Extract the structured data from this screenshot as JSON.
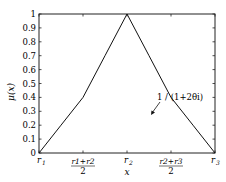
{
  "chart_data": {
    "type": "line",
    "title": "",
    "xlabel": "x",
    "ylabel": "μ(x)",
    "ylim": [
      0,
      1
    ],
    "yticks": [
      "0",
      "0.1",
      "0.2",
      "0.3",
      "0.4",
      "0.5",
      "0.6",
      "0.7",
      "0.8",
      "0.9",
      "1"
    ],
    "xticks": [
      {
        "label": "r1",
        "pos": 0
      },
      {
        "label": "(r1+r2)/2",
        "pos": 0.5
      },
      {
        "label": "r2",
        "pos": 1
      },
      {
        "label": "(r2+r3)/2",
        "pos": 1.5
      },
      {
        "label": "r3",
        "pos": 2
      }
    ],
    "grid": false,
    "series": [
      {
        "name": "membership",
        "x": [
          0,
          0.25,
          0.5,
          0.75,
          1.0,
          1.25,
          1.5,
          1.75,
          2.0
        ],
        "y": [
          0,
          0.2,
          0.4,
          0.7,
          1.0,
          0.7,
          0.4,
          0.2,
          0
        ]
      }
    ],
    "annotations": [
      {
        "text": "1 / (1+2θ_i)",
        "at_x": 1.5,
        "at_y": 0.4
      }
    ]
  },
  "labels": {
    "ylabel_text": "μ(x)",
    "xlabel_text": "x",
    "annotation_text": "1 / (1+2θi)",
    "xtick_r1": "r",
    "xtick_r1_sub": "1",
    "xtick_r2": "r",
    "xtick_r2_sub": "2",
    "xtick_r3": "r",
    "xtick_r3_sub": "3",
    "xtick_mid1_num": "r1+r2",
    "xtick_mid2_num": "r2+r3",
    "xtick_den": "2"
  }
}
